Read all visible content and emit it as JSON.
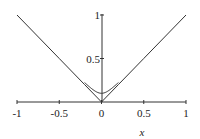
{
  "chart_data": {
    "type": "line",
    "title": "",
    "xlabel": "x",
    "ylabel": "",
    "xlim": [
      -1,
      1
    ],
    "ylim": [
      0,
      1
    ],
    "grid": false,
    "legend": null,
    "x_ticks": [
      -1,
      -0.5,
      0,
      0.5,
      1
    ],
    "x_tick_labels": [
      "-1",
      "-0.5",
      "0",
      "0.5",
      "1"
    ],
    "y_ticks": [
      0.5,
      1
    ],
    "y_tick_labels": [
      "0.5",
      "1"
    ],
    "series": [
      {
        "name": "|x|",
        "x": [
          -1,
          -0.5,
          -0.2,
          0,
          0.2,
          0.5,
          1
        ],
        "y": [
          1,
          0.5,
          0.2,
          0,
          0.2,
          0.5,
          1
        ]
      },
      {
        "name": "smooth approximation of |x|",
        "x": [
          -0.2,
          -0.15,
          -0.1,
          -0.05,
          0,
          0.05,
          0.1,
          0.15,
          0.2
        ],
        "y": [
          0.2,
          0.16,
          0.125,
          0.105,
          0.1,
          0.105,
          0.125,
          0.16,
          0.2
        ]
      }
    ]
  }
}
